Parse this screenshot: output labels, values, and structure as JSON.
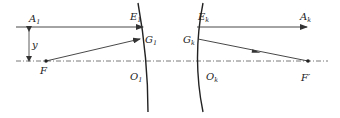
{
  "diagram": {
    "type": "optics-ray-diagram",
    "colors": {
      "line": "#333333",
      "axis": "#555555",
      "background": "#ffffff"
    },
    "labels": {
      "A1": {
        "main": "A",
        "sub": "1"
      },
      "E1": {
        "main": "E",
        "sub": "1"
      },
      "G1": {
        "main": "G",
        "sub": "1"
      },
      "O1": {
        "main": "O",
        "sub": "1"
      },
      "y": {
        "main": "y"
      },
      "F": {
        "main": "F"
      },
      "Ek": {
        "main": "E",
        "sub": "k"
      },
      "Gk": {
        "main": "G",
        "sub": "k"
      },
      "Ok": {
        "main": "O",
        "sub": "k"
      },
      "Ak": {
        "main": "A",
        "sub": "k"
      },
      "Fprime": {
        "main": "F′"
      }
    },
    "elements": [
      "optical axis (dash-dot)",
      "left curved mirror surface 1",
      "right curved mirror surface k",
      "incident ray A1 to E1",
      "ray from F to G1",
      "outgoing ray Ek to Ak",
      "ray from Gk to F′",
      "height y dimension between A1 ray and axis"
    ]
  }
}
